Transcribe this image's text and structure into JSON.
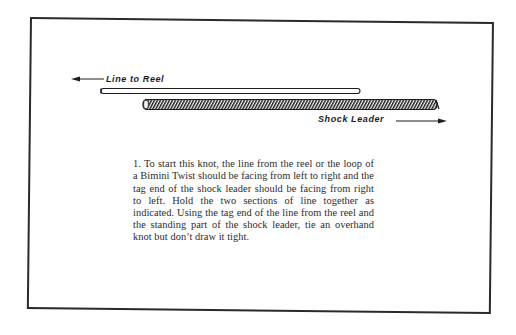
{
  "figure": {
    "labels": {
      "line_to_reel": "Line to Reel",
      "shock_leader": "Shock Leader"
    },
    "arrows": {
      "line_to_reel_direction": "left",
      "shock_leader_direction": "right"
    },
    "colors": {
      "ink": "#1d1d1d",
      "paper": "#ffffff",
      "border": "#2a2a2a"
    }
  },
  "caption": {
    "step_number": "1.",
    "text": "To start this knot, the line from the reel or the loop of a Bimini Twist should be facing from left to right and the tag end of the shock leader should be facing from right to left. Hold the two sections of line together as indicated. Using the tag end of the line from the reel and the standing part of the shock leader, tie an overhand knot but don’t draw it tight."
  }
}
